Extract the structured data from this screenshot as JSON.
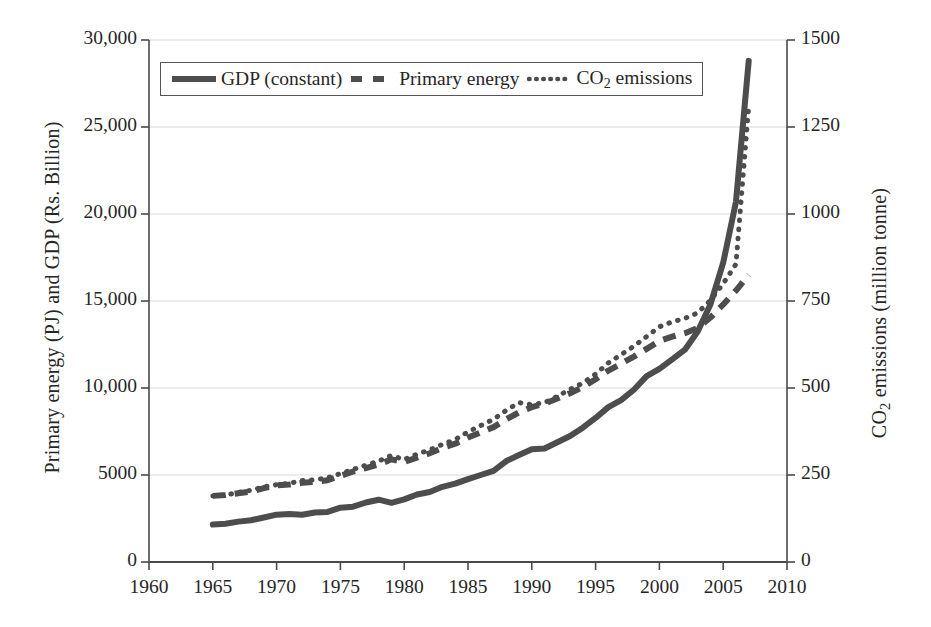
{
  "figure": {
    "background": "#ffffff",
    "ink_color": "#4d4d4d",
    "grid_color": "#d9d9d9",
    "axis_color": "#4a4a4a"
  },
  "axes": {
    "x": {
      "label": "",
      "ticks": [
        "1960",
        "1965",
        "1970",
        "1975",
        "1980",
        "1985",
        "1990",
        "1995",
        "2000",
        "2005",
        "2010"
      ],
      "min": 1960,
      "max": 2010
    },
    "y_left": {
      "label": "Primary energy (PJ) and GDP (Rs. Billion)",
      "ticks": [
        "0",
        "5000",
        "10,000",
        "15,000",
        "20,000",
        "25,000",
        "30,000"
      ],
      "min": 0,
      "max": 30000
    },
    "y_right": {
      "label_prefix": "CO",
      "label_sub": "2",
      "label_suffix": " emissions (million tonne)",
      "ticks": [
        "0",
        "250",
        "500",
        "750",
        "1000",
        "1250",
        "1500"
      ],
      "min": 0,
      "max": 1500
    }
  },
  "legend": {
    "position": "top-left-inside",
    "entries": [
      {
        "label": "GDP (constant)",
        "style": "solid",
        "swatch": "solid-line-swatch"
      },
      {
        "label": "Primary energy",
        "style": "dashed",
        "swatch": "dashed-line-swatch"
      },
      {
        "label_prefix": "CO",
        "label_sub": "2",
        "label_suffix": " emissions",
        "style": "dotted",
        "swatch": "dotted-line-swatch"
      }
    ]
  },
  "chart_data": {
    "type": "line",
    "title": "",
    "xlabel": "",
    "ylabel": "Primary energy (PJ) and GDP (Rs. Billion)",
    "y2label": "CO2 emissions (million tonne)",
    "xlim": [
      1960,
      2010
    ],
    "ylim": [
      0,
      30000
    ],
    "y2lim": [
      0,
      1500
    ],
    "grid": "horizontal",
    "legend_position": "upper left",
    "x": [
      1965,
      1966,
      1967,
      1968,
      1969,
      1970,
      1971,
      1972,
      1973,
      1974,
      1975,
      1976,
      1977,
      1978,
      1979,
      1980,
      1981,
      1982,
      1983,
      1984,
      1985,
      1986,
      1987,
      1988,
      1989,
      1990,
      1991,
      1992,
      1993,
      1994,
      1995,
      1996,
      1997,
      1998,
      1999,
      2000,
      2001,
      2002,
      2003,
      2004,
      2005,
      2006,
      2007
    ],
    "series": [
      {
        "name": "GDP (constant)",
        "axis": "left",
        "units": "Rs. Billion",
        "style": "solid",
        "values": [
          2150,
          2180,
          2300,
          2360,
          2520,
          2680,
          2700,
          2680,
          2800,
          2830,
          3080,
          3120,
          3350,
          3520,
          3330,
          3560,
          3780,
          3900,
          4230,
          4400,
          4640,
          4870,
          5090,
          5620,
          5960,
          6290,
          6320,
          6670,
          7010,
          7470,
          8020,
          8620,
          9010,
          9600,
          10320,
          10700,
          11220,
          11750,
          12720,
          13670,
          14980,
          16410,
          17990
        ],
        "values_rendered": [
          2150,
          2180,
          2300,
          2360,
          2520,
          2680,
          2700,
          2680,
          2800,
          2830,
          3080,
          3120,
          3350,
          3520,
          3330,
          3560,
          3780,
          3900,
          4230,
          4400,
          4640,
          4870,
          5090,
          5620,
          5960,
          6290,
          6320,
          6670,
          7010,
          7470,
          8020,
          8620,
          9010,
          9600,
          10320,
          10700,
          11220,
          11750,
          12720,
          13670,
          14980,
          16410,
          17990
        ],
        "plot_values": [
          2150,
          2200,
          2320,
          2400,
          2560,
          2720,
          2760,
          2720,
          2840,
          2880,
          3120,
          3180,
          3420,
          3580,
          3400,
          3600,
          3880,
          4020,
          4320,
          4500,
          4760,
          5000,
          5240,
          5800,
          6150,
          6480,
          6520,
          6880,
          7240,
          7720,
          8280,
          8900,
          9300,
          9900,
          10680,
          11100,
          11650,
          12200,
          13250,
          14800,
          17200,
          20700,
          28800
        ]
      },
      {
        "name": "Primary energy",
        "axis": "left",
        "units": "PJ",
        "style": "dashed",
        "values": [
          3800,
          3850,
          3950,
          4050,
          4250,
          4400,
          4450,
          4550,
          4600,
          4700,
          4950,
          5200,
          5400,
          5600,
          5900,
          5750,
          6000,
          6250,
          6550,
          6800,
          7150,
          7450,
          7750,
          8200,
          8600,
          8900,
          9100,
          9400,
          9700,
          10050,
          10500,
          11000,
          11400,
          11800,
          12250,
          12700,
          12950,
          13150,
          13450,
          14050,
          14800,
          15600,
          16500
        ],
        "plot_values": [
          3800,
          3850,
          3950,
          4050,
          4250,
          4400,
          4450,
          4550,
          4600,
          4700,
          4950,
          5200,
          5400,
          5600,
          5900,
          5750,
          6000,
          6250,
          6550,
          6800,
          7150,
          7450,
          7750,
          8200,
          8600,
          8900,
          9100,
          9400,
          9700,
          10050,
          10500,
          11000,
          11400,
          11800,
          12250,
          12700,
          12950,
          13150,
          13450,
          14050,
          14800,
          15600,
          16500
        ]
      },
      {
        "name": "CO2 emissions",
        "axis": "right",
        "units": "million tonne",
        "style": "dotted",
        "values": [
          190,
          192,
          200,
          206,
          216,
          222,
          226,
          234,
          236,
          242,
          254,
          266,
          278,
          290,
          306,
          294,
          310,
          322,
          338,
          352,
          374,
          392,
          410,
          436,
          458,
          452,
          458,
          476,
          496,
          514,
          540,
          572,
          596,
          620,
          648,
          676,
          690,
          700,
          716,
          752,
          800,
          856,
          1310
        ],
        "values_right_axis": [
          190,
          192,
          200,
          206,
          216,
          222,
          226,
          234,
          236,
          242,
          254,
          266,
          278,
          290,
          306,
          294,
          310,
          322,
          338,
          352,
          374,
          392,
          410,
          436,
          458,
          452,
          458,
          476,
          496,
          514,
          540,
          572,
          596,
          620,
          648,
          676,
          690,
          700,
          716,
          752,
          800,
          856,
          1310
        ],
        "plot_values_left_scale": [
          3800,
          3840,
          4000,
          4120,
          4320,
          4440,
          4520,
          4680,
          4720,
          4840,
          5080,
          5320,
          5560,
          5800,
          6120,
          5880,
          6200,
          6440,
          6760,
          7040,
          7480,
          7840,
          8200,
          8720,
          9160,
          9040,
          9160,
          9520,
          9920,
          10280,
          10800,
          11440,
          11920,
          12400,
          12960,
          13520,
          13800,
          14000,
          14320,
          15040,
          16000,
          17120,
          26200
        ]
      }
    ]
  }
}
